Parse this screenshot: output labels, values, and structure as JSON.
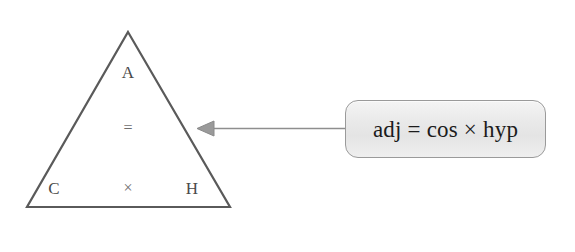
{
  "figure": {
    "name": "trigonometry-formula-triangle",
    "background_color": "#ffffff"
  },
  "triangle": {
    "stroke_color": "#5a5a5a",
    "fill_color": "#ffffff",
    "vertices": {
      "apex": [
        128,
        32
      ],
      "bottom_left": [
        27,
        207
      ],
      "bottom_right": [
        230,
        207
      ]
    },
    "labels": [
      {
        "id": "adjacent",
        "text": "A",
        "x": 128,
        "y": 72,
        "kind": "letter"
      },
      {
        "id": "equals",
        "text": "=",
        "x": 128,
        "y": 128,
        "kind": "operator"
      },
      {
        "id": "cosine",
        "text": "C",
        "x": 54,
        "y": 188,
        "kind": "letter"
      },
      {
        "id": "times",
        "text": "×",
        "x": 128,
        "y": 188,
        "kind": "operator"
      },
      {
        "id": "hypotenuse",
        "text": "H",
        "x": 192,
        "y": 188,
        "kind": "letter"
      }
    ]
  },
  "arrow": {
    "name": "callout-arrow",
    "color": "#8e8e8e",
    "direction": "left",
    "tip": [
      197,
      128
    ],
    "tail": [
      345,
      128
    ]
  },
  "callout": {
    "text": "adj = cos × hyp",
    "border_color": "#9a9a9a",
    "fill_color": "#e9e9e9",
    "text_color": "#1b1b1b"
  }
}
